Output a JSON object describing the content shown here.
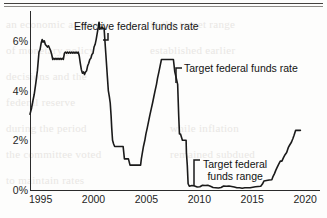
{
  "page": {
    "bleed_text": [
      {
        "t": "an economic analysis",
        "x": 6,
        "y": 18
      },
      {
        "t": "of monetary policy",
        "x": 6,
        "y": 44
      },
      {
        "t": "decisions and the",
        "x": 6,
        "y": 70
      },
      {
        "t": "federal reserve",
        "x": 6,
        "y": 96
      },
      {
        "t": "during the period",
        "x": 6,
        "y": 122
      },
      {
        "t": "the committee voted",
        "x": 6,
        "y": 148
      },
      {
        "t": "to maintain rates",
        "x": 6,
        "y": 174
      },
      {
        "t": "in the target range",
        "x": 150,
        "y": 18
      },
      {
        "t": "established earlier",
        "x": 150,
        "y": 44
      },
      {
        "t": "while inflation",
        "x": 170,
        "y": 122
      },
      {
        "t": "remained subdued",
        "x": 170,
        "y": 148
      }
    ]
  },
  "chart_data": {
    "type": "line",
    "title": "",
    "xlabel": "",
    "ylabel": "",
    "xlim": [
      1994.0,
      2021.4
    ],
    "ylim": [
      0,
      7.2
    ],
    "grid": false,
    "legend_position": "inline-annotations",
    "y_ticks": [
      "0%",
      "2%",
      "4%",
      "6%"
    ],
    "y_tick_values": [
      0,
      2,
      4,
      6
    ],
    "x_ticks": [
      "1995",
      "2000",
      "2005",
      "2010",
      "2015",
      "2020"
    ],
    "x_tick_values": [
      1995,
      2000,
      2005,
      2010,
      2015,
      2020
    ],
    "annotations": [
      {
        "name": "effective-federal-funds-rate",
        "text": "Effective federal funds rate",
        "x": 74,
        "y": 20,
        "leader": {
          "x1": 108,
          "y1": 33,
          "x2": 108,
          "y2": 40,
          "x3": 103,
          "y3": 40
        }
      },
      {
        "name": "target-federal-funds-rate",
        "text": "Target federal funds rate",
        "x": 184,
        "y": 62,
        "leader": {
          "x1": 182,
          "y1": 68,
          "x2": 176,
          "y2": 68,
          "x3": 176,
          "y3": 83
        }
      },
      {
        "name": "target-federal-funds-range",
        "text_line1": "Target federal",
        "text_line2": "funds range",
        "x": 203,
        "y": 158,
        "leader": {
          "x1": 200,
          "y1": 160,
          "x2": 194,
          "y2": 160,
          "x3": 194,
          "y3": 186
        }
      }
    ],
    "series": [
      {
        "name": "Effective / target federal funds rate",
        "color": "#1a1a1a",
        "points": [
          [
            1994.0,
            3.05
          ],
          [
            1994.15,
            3.3
          ],
          [
            1994.28,
            3.6
          ],
          [
            1994.4,
            3.85
          ],
          [
            1994.55,
            4.3
          ],
          [
            1994.7,
            4.8
          ],
          [
            1994.85,
            5.55
          ],
          [
            1994.95,
            5.65
          ],
          [
            1995.05,
            5.9
          ],
          [
            1995.15,
            6.05
          ],
          [
            1995.25,
            5.95
          ],
          [
            1995.35,
            6.0
          ],
          [
            1995.45,
            5.85
          ],
          [
            1995.55,
            5.8
          ],
          [
            1995.65,
            5.75
          ],
          [
            1995.75,
            5.8
          ],
          [
            1995.85,
            5.7
          ],
          [
            1995.95,
            5.6
          ],
          [
            1996.05,
            5.45
          ],
          [
            1996.15,
            5.25
          ],
          [
            1996.25,
            5.3
          ],
          [
            1996.35,
            5.25
          ],
          [
            1996.45,
            5.3
          ],
          [
            1996.55,
            5.25
          ],
          [
            1996.65,
            5.3
          ],
          [
            1996.75,
            5.25
          ],
          [
            1996.85,
            5.3
          ],
          [
            1996.95,
            5.25
          ],
          [
            1997.05,
            5.3
          ],
          [
            1997.15,
            5.25
          ],
          [
            1997.25,
            5.5
          ],
          [
            1997.35,
            5.55
          ],
          [
            1997.45,
            5.5
          ],
          [
            1997.55,
            5.55
          ],
          [
            1997.65,
            5.5
          ],
          [
            1997.75,
            5.55
          ],
          [
            1997.85,
            5.5
          ],
          [
            1997.95,
            5.55
          ],
          [
            1998.05,
            5.5
          ],
          [
            1998.15,
            5.55
          ],
          [
            1998.25,
            5.5
          ],
          [
            1998.35,
            5.55
          ],
          [
            1998.45,
            5.5
          ],
          [
            1998.55,
            5.55
          ],
          [
            1998.65,
            5.4
          ],
          [
            1998.75,
            5.1
          ],
          [
            1998.85,
            4.85
          ],
          [
            1998.95,
            4.7
          ],
          [
            1999.05,
            4.75
          ],
          [
            1999.15,
            4.65
          ],
          [
            1999.25,
            4.75
          ],
          [
            1999.35,
            4.8
          ],
          [
            1999.45,
            5.0
          ],
          [
            1999.55,
            5.1
          ],
          [
            1999.65,
            5.25
          ],
          [
            1999.75,
            5.3
          ],
          [
            1999.85,
            5.45
          ],
          [
            1999.95,
            5.5
          ],
          [
            2000.05,
            5.75
          ],
          [
            2000.15,
            5.85
          ],
          [
            2000.25,
            6.05
          ],
          [
            2000.35,
            6.3
          ],
          [
            2000.45,
            6.55
          ],
          [
            2000.52,
            6.75
          ],
          [
            2000.6,
            6.5
          ],
          [
            2000.7,
            6.5
          ],
          [
            2000.8,
            6.55
          ],
          [
            2000.9,
            6.5
          ],
          [
            2001.0,
            6.5
          ],
          [
            2001.08,
            6.0
          ],
          [
            2001.16,
            5.5
          ],
          [
            2001.24,
            5.0
          ],
          [
            2001.32,
            4.5
          ],
          [
            2001.4,
            4.0
          ],
          [
            2001.5,
            3.75
          ],
          [
            2001.58,
            3.5
          ],
          [
            2001.66,
            3.0
          ],
          [
            2001.72,
            2.5
          ],
          [
            2001.8,
            2.0
          ],
          [
            2001.9,
            1.85
          ],
          [
            2002.0,
            1.75
          ],
          [
            2002.2,
            1.75
          ],
          [
            2002.4,
            1.75
          ],
          [
            2002.6,
            1.75
          ],
          [
            2002.8,
            1.75
          ],
          [
            2002.92,
            1.25
          ],
          [
            2003.1,
            1.25
          ],
          [
            2003.3,
            1.25
          ],
          [
            2003.45,
            1.0
          ],
          [
            2003.7,
            1.0
          ],
          [
            2003.95,
            1.0
          ],
          [
            2004.2,
            1.0
          ],
          [
            2004.45,
            1.0
          ],
          [
            2004.52,
            1.25
          ],
          [
            2004.62,
            1.5
          ],
          [
            2004.72,
            1.75
          ],
          [
            2004.85,
            2.0
          ],
          [
            2004.95,
            2.25
          ],
          [
            2005.08,
            2.5
          ],
          [
            2005.2,
            2.75
          ],
          [
            2005.32,
            3.0
          ],
          [
            2005.45,
            3.25
          ],
          [
            2005.58,
            3.5
          ],
          [
            2005.7,
            3.75
          ],
          [
            2005.82,
            4.0
          ],
          [
            2005.95,
            4.25
          ],
          [
            2006.05,
            4.5
          ],
          [
            2006.18,
            4.75
          ],
          [
            2006.3,
            5.0
          ],
          [
            2006.42,
            5.25
          ],
          [
            2006.55,
            5.25
          ],
          [
            2006.8,
            5.25
          ],
          [
            2007.05,
            5.25
          ],
          [
            2007.3,
            5.25
          ],
          [
            2007.55,
            5.25
          ],
          [
            2007.68,
            4.75
          ],
          [
            2007.82,
            4.5
          ],
          [
            2007.95,
            4.25
          ],
          [
            2008.05,
            3.0
          ],
          [
            2008.12,
            2.25
          ],
          [
            2008.22,
            2.25
          ],
          [
            2008.4,
            2.0
          ],
          [
            2008.6,
            2.0
          ],
          [
            2008.75,
            2.0
          ],
          [
            2008.78,
            1.5
          ],
          [
            2008.86,
            1.0
          ],
          [
            2008.94,
            0.25
          ],
          [
            2009.05,
            0.15
          ],
          [
            2009.3,
            0.18
          ],
          [
            2009.55,
            0.16
          ],
          [
            2009.8,
            0.12
          ],
          [
            2010.05,
            0.13
          ],
          [
            2010.3,
            0.19
          ],
          [
            2010.55,
            0.18
          ],
          [
            2010.8,
            0.19
          ],
          [
            2011.05,
            0.15
          ],
          [
            2011.3,
            0.1
          ],
          [
            2011.55,
            0.09
          ],
          [
            2011.8,
            0.08
          ],
          [
            2012.05,
            0.1
          ],
          [
            2012.3,
            0.16
          ],
          [
            2012.55,
            0.15
          ],
          [
            2012.8,
            0.16
          ],
          [
            2013.05,
            0.14
          ],
          [
            2013.3,
            0.12
          ],
          [
            2013.55,
            0.09
          ],
          [
            2013.8,
            0.09
          ],
          [
            2014.05,
            0.07
          ],
          [
            2014.3,
            0.09
          ],
          [
            2014.55,
            0.09
          ],
          [
            2014.8,
            0.09
          ],
          [
            2015.05,
            0.11
          ],
          [
            2015.3,
            0.13
          ],
          [
            2015.55,
            0.14
          ],
          [
            2015.8,
            0.15
          ],
          [
            2015.96,
            0.24
          ],
          [
            2016.1,
            0.36
          ],
          [
            2016.35,
            0.38
          ],
          [
            2016.6,
            0.4
          ],
          [
            2016.85,
            0.41
          ],
          [
            2016.97,
            0.55
          ],
          [
            2017.1,
            0.66
          ],
          [
            2017.22,
            0.79
          ],
          [
            2017.35,
            0.91
          ],
          [
            2017.5,
            1.04
          ],
          [
            2017.65,
            1.16
          ],
          [
            2017.8,
            1.16
          ],
          [
            2017.95,
            1.3
          ],
          [
            2018.1,
            1.42
          ],
          [
            2018.25,
            1.51
          ],
          [
            2018.4,
            1.7
          ],
          [
            2018.55,
            1.82
          ],
          [
            2018.7,
            1.92
          ],
          [
            2018.85,
            2.08
          ],
          [
            2018.95,
            2.2
          ],
          [
            2019.1,
            2.4
          ],
          [
            2019.25,
            2.4
          ],
          [
            2019.4,
            2.4
          ],
          [
            2019.55,
            2.4
          ]
        ]
      }
    ]
  }
}
